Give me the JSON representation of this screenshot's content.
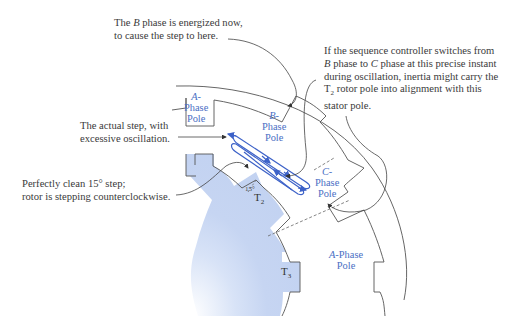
{
  "diagram": {
    "colors": {
      "rotor_fill": "#c6d5f2",
      "pole_label": "#4a6fc4",
      "oscillation_path": "#3d62c8",
      "line": "#555555",
      "text": "#3a3a3a"
    },
    "annotations": {
      "b_phase_energized": {
        "line1_pre": "The ",
        "line1_italic": "B",
        "line1_post": " phase is energized now,",
        "line2": "to cause the step to here."
      },
      "actual_step": {
        "line1": "The actual step, with",
        "line2": "excessive oscillation."
      },
      "clean_step": {
        "line1": "Perfectly clean 15° step;",
        "line2": "rotor is stepping counterclockwise."
      },
      "sequence_controller": {
        "line1": "If the sequence controller switches from",
        "line2_i1": "B",
        "line2_mid": " phase to ",
        "line2_i2": "C",
        "line2_post": " phase at this precise instant",
        "line3": "during oscillation, inertia might carry the",
        "line4_pre": "T",
        "line4_sub": "2",
        "line4_post": " rotor pole into alignment with this",
        "line5": "stator pole."
      }
    },
    "stator_poles": [
      {
        "id": "A-top",
        "letter": "A",
        "dash": "-",
        "line2": "Phase",
        "line3": "Pole"
      },
      {
        "id": "B",
        "letter": "B",
        "dash": "-",
        "line2": "Phase",
        "line3": "Pole"
      },
      {
        "id": "C",
        "letter": "C",
        "dash": "-",
        "line2": "Phase",
        "line3": "Pole"
      },
      {
        "id": "A-bottom",
        "letter": "A",
        "dash": "-Phase",
        "line3": "Pole"
      }
    ],
    "rotor_poles": [
      {
        "id": "T2",
        "base": "T",
        "sub": "2"
      },
      {
        "id": "T3",
        "base": "T",
        "sub": "3"
      }
    ],
    "angle_label": "15°"
  }
}
